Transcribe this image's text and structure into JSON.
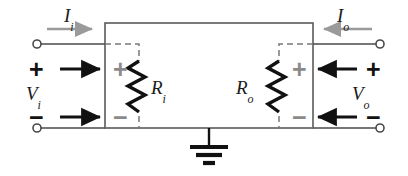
{
  "figure": {
    "background_color": "#ffffff",
    "width": 408,
    "height": 176
  },
  "colors": {
    "wire": "#4a4a4a",
    "box": "#5a5a5a",
    "dashed": "#7a7a7a",
    "resistor": "#111111",
    "current_arrow": "#9a9a9a",
    "voltage_arrow": "#111111",
    "sign_black": "#111111",
    "sign_gray": "#8a8a8a",
    "ground": "#111111",
    "label_text": "#1b1b1b"
  },
  "labels": {
    "current_in": {
      "base": "I",
      "sub": "i",
      "full": "Ii"
    },
    "current_out": {
      "base": "I",
      "sub": "o",
      "full": "Io"
    },
    "voltage_in": {
      "base": "V",
      "sub": "i",
      "full": "Vi"
    },
    "voltage_out": {
      "base": "V",
      "sub": "o",
      "full": "Vo"
    },
    "resistor_in": {
      "base": "R",
      "sub": "i",
      "full": "Ri"
    },
    "resistor_out": {
      "base": "R",
      "sub": "o",
      "full": "Ro"
    }
  },
  "polarity": {
    "input_outer_plus": "+",
    "input_outer_minus": "−",
    "input_inner_plus": "+",
    "input_inner_minus": "−",
    "output_inner_plus": "+",
    "output_inner_minus": "−",
    "output_outer_plus": "+",
    "output_outer_minus": "−"
  },
  "components": [
    {
      "name": "input-resistance",
      "symbol": "resistor",
      "label": "Ri",
      "side": "input"
    },
    {
      "name": "output-resistance",
      "symbol": "resistor",
      "label": "Ro",
      "side": "output"
    },
    {
      "name": "ground-reference",
      "symbol": "ground",
      "label": ""
    }
  ],
  "terminals": [
    {
      "name": "input-top-terminal",
      "type": "open-circle",
      "x": 37,
      "y": 44
    },
    {
      "name": "input-bottom-terminal",
      "type": "open-circle",
      "x": 37,
      "y": 128
    },
    {
      "name": "output-top-terminal",
      "type": "open-circle",
      "x": 380,
      "y": 44
    },
    {
      "name": "output-bottom-terminal",
      "type": "open-circle",
      "x": 380,
      "y": 128
    }
  ],
  "arrows": [
    {
      "name": "input-current-arrow",
      "label": "Ii",
      "direction": "right",
      "style": "gray"
    },
    {
      "name": "output-current-arrow",
      "label": "Io",
      "direction": "left",
      "style": "gray"
    },
    {
      "name": "input-top-voltage-arrow",
      "direction": "right",
      "style": "black"
    },
    {
      "name": "input-bottom-voltage-arrow",
      "direction": "right",
      "style": "black"
    },
    {
      "name": "output-top-voltage-arrow",
      "direction": "left",
      "style": "black"
    },
    {
      "name": "output-bottom-voltage-arrow",
      "direction": "left",
      "style": "black"
    }
  ]
}
